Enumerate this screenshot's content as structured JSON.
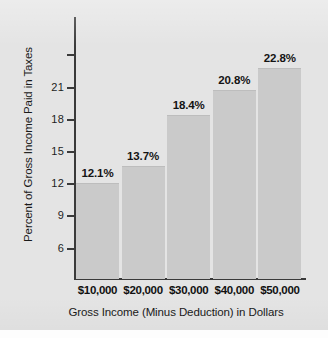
{
  "chart_data": {
    "type": "bar",
    "title": "",
    "xlabel": "Gross Income (Minus Deduction) in Dollars",
    "ylabel": "Percent of Gross Income Paid in Taxes",
    "categories": [
      "$10,000",
      "$20,000",
      "$30,000",
      "$40,000",
      "$50,000"
    ],
    "values": [
      12.1,
      13.7,
      18.4,
      20.8,
      22.8
    ],
    "value_labels": [
      "12.1%",
      "13.7%",
      "18.4%",
      "20.8%",
      "22.8%"
    ],
    "ytick_values": [
      6,
      9,
      12,
      15,
      18,
      21,
      24
    ],
    "ytick_labels": [
      "6",
      "9",
      "12",
      "15",
      "18",
      "21",
      ""
    ],
    "ylim": [
      3.2,
      24.5
    ],
    "grid": false,
    "legend": null,
    "bar_color": "#cacaca",
    "axis_color": "#3a3a3a",
    "background_color": "#e4e4e4",
    "text_color": "#1a1a1a"
  }
}
